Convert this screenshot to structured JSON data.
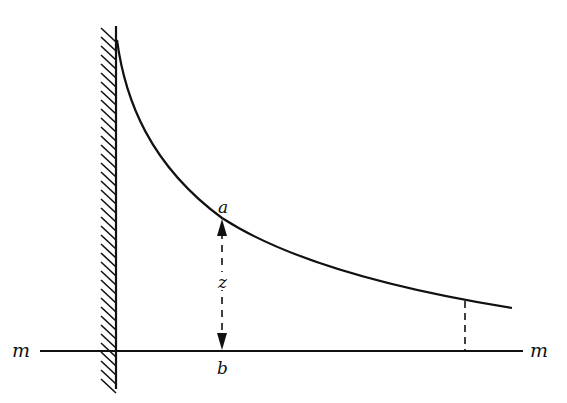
{
  "diagram": {
    "colors": {
      "stroke": "#111111",
      "background": "#ffffff"
    },
    "labels": {
      "point_a": "a",
      "point_b": "b",
      "height": "z",
      "line_left": "m",
      "line_right": "m"
    },
    "wall": {
      "x": 116,
      "y_top": 26,
      "y_bottom": 389,
      "hatched": true,
      "hatch_side": "left"
    },
    "baseline": {
      "y": 351,
      "x_start": 40,
      "x_end": 523
    },
    "curve_points": [
      [
        117,
        50
      ],
      [
        122,
        80
      ],
      [
        130,
        105
      ],
      [
        145,
        140
      ],
      [
        170,
        178
      ],
      [
        195,
        200
      ],
      [
        222,
        218
      ],
      [
        290,
        252
      ],
      [
        350,
        270
      ],
      [
        400,
        285
      ],
      [
        465,
        300
      ],
      [
        512,
        308
      ]
    ],
    "dimension": {
      "x": 222,
      "y_top": 218,
      "y_bottom": 351,
      "style": "dashed double arrow"
    },
    "right_dashed_line": {
      "x": 465,
      "y_top": 300,
      "y_bottom": 351
    }
  }
}
